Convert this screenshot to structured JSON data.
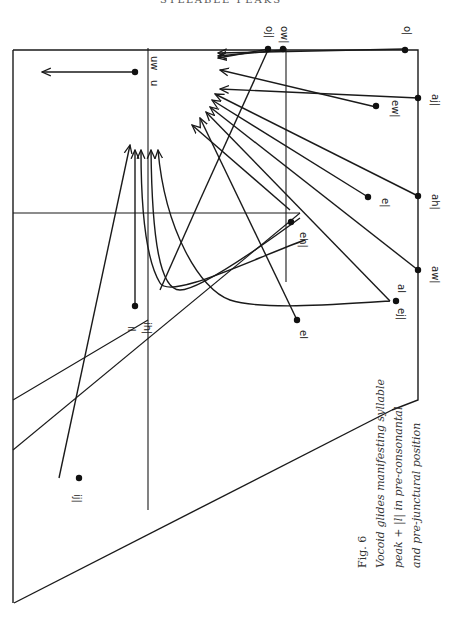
{
  "header": {
    "running_title": "SYLLABLE PEAKS"
  },
  "figure": {
    "number_label": "Fig. 6",
    "caption_lines": [
      "Vocoid glides manifesting syllable",
      "peak + |l| in pre-consonantal",
      "and pre-junctural position"
    ],
    "axis_labels": [
      {
        "id": "u",
        "text": "u"
      },
      {
        "id": "uw",
        "text": "uw"
      }
    ],
    "start_points": [
      {
        "id": "oj",
        "text": "oj|"
      },
      {
        "id": "ow",
        "text": "ow|"
      },
      {
        "id": "o",
        "text": "o|"
      },
      {
        "id": "ew",
        "text": "ew|"
      },
      {
        "id": "aj",
        "text": "aj|"
      },
      {
        "id": "ah",
        "text": "ah|"
      },
      {
        "id": "e",
        "text": "e|"
      },
      {
        "id": "eh",
        "text": "eh|"
      },
      {
        "id": "aw",
        "text": "aw|"
      },
      {
        "id": "al",
        "text": "al"
      },
      {
        "id": "ej",
        "text": "ej|"
      },
      {
        "id": "el",
        "text": "el"
      },
      {
        "id": "il",
        "text": "il"
      },
      {
        "id": "ih",
        "text": "ih|"
      },
      {
        "id": "ij",
        "text": "ij|"
      }
    ]
  }
}
